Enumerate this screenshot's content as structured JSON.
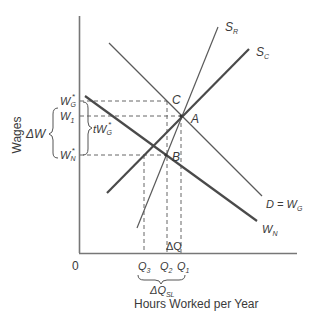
{
  "axes": {
    "y_label": "Wages",
    "x_label": "Hours Worked per Year",
    "origin": "0"
  },
  "y_ticks": [
    {
      "id": "WG",
      "base": "W",
      "sub": "G",
      "sup": "*",
      "y": 101
    },
    {
      "id": "W1",
      "base": "W",
      "sub": "1",
      "sup": "",
      "y": 116
    },
    {
      "id": "WN",
      "base": "W",
      "sub": "N",
      "sup": "*",
      "y": 155
    }
  ],
  "x_ticks": [
    {
      "id": "Q3",
      "base": "Q",
      "sub": "3",
      "x": 144
    },
    {
      "id": "Q2",
      "base": "Q",
      "sub": "2",
      "x": 167
    },
    {
      "id": "Q1",
      "base": "Q",
      "sub": "1",
      "x": 181
    }
  ],
  "curves": [
    {
      "id": "SR",
      "label_base": "S",
      "label_sub": "R",
      "from": [
        137,
        228
      ],
      "to": [
        218,
        27
      ],
      "weight": "thin"
    },
    {
      "id": "SC",
      "label_base": "S",
      "label_sub": "C",
      "from": [
        107,
        193
      ],
      "to": [
        249,
        49
      ],
      "weight": "thick"
    },
    {
      "id": "D",
      "label": "D = W",
      "label_sub": "G",
      "from": [
        109,
        43
      ],
      "to": [
        262,
        196
      ],
      "weight": "thin"
    },
    {
      "id": "WN",
      "label_base": "W",
      "label_sub": "N",
      "from": [
        85,
        96
      ],
      "to": [
        257,
        221
      ],
      "weight": "thick"
    }
  ],
  "points": [
    {
      "id": "A",
      "label": "A",
      "x": 181,
      "y": 116
    },
    {
      "id": "B",
      "label": "B",
      "x": 166,
      "y": 155
    },
    {
      "id": "C",
      "label": "C",
      "x": 167,
      "y": 101
    }
  ],
  "annotations": {
    "delta_w": "ΔW",
    "tax_wedge_base": "tW",
    "tax_wedge_sub": "G",
    "tax_wedge_sup": "*",
    "delta_q": "ΔQ",
    "delta_q_sl_base": "ΔQ",
    "delta_q_sl_sub": "SL"
  },
  "colors": {
    "line": "#5a5a5a",
    "thick_line": "#4a4a4a",
    "axis": "#777777",
    "text": "#3a3a3a"
  }
}
